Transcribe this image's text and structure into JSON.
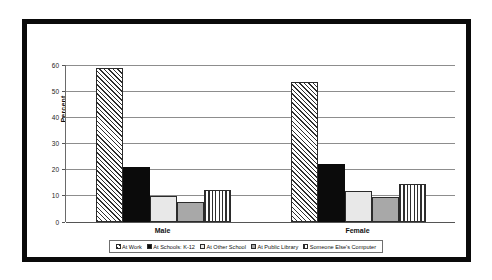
{
  "chart_data": {
    "type": "bar",
    "title": "",
    "xlabel": "",
    "ylabel": "Percent",
    "ylim": [
      0,
      60
    ],
    "yticks": [
      0,
      10,
      20,
      30,
      40,
      50,
      60
    ],
    "grid": true,
    "legend_position": "bottom",
    "categories": [
      "Male",
      "Female"
    ],
    "series": [
      {
        "name": "At Work",
        "pattern": "diagonal-hatch",
        "color": "#ffffff",
        "values": [
          59.0,
          53.7
        ]
      },
      {
        "name": "At Schools: K-12",
        "pattern": "solid-black",
        "color": "#0b0b0b",
        "values": [
          21.0,
          22.3
        ]
      },
      {
        "name": "At Other School",
        "pattern": "light-gray",
        "color": "#e8e8e8",
        "values": [
          9.8,
          12.0
        ]
      },
      {
        "name": "At Public Library",
        "pattern": "medium-gray",
        "color": "#a8a8a8",
        "values": [
          7.6,
          9.4
        ]
      },
      {
        "name": "Someone Else's Computer",
        "pattern": "vertical-stripe",
        "color": "#ffffff",
        "values": [
          12.3,
          14.6
        ]
      }
    ]
  },
  "axis": {
    "y_title": "Percent",
    "y_tick_labels": [
      "60",
      "50",
      "40",
      "30",
      "20",
      "10",
      "0"
    ]
  },
  "groups": [
    {
      "label": "Male"
    },
    {
      "label": "Female"
    }
  ],
  "legend": {
    "items": [
      {
        "label": "At Work"
      },
      {
        "label": "At Schools: K-12"
      },
      {
        "label": "At Other School"
      },
      {
        "label": "At Public Library"
      },
      {
        "label": "Someone Else's Computer"
      }
    ]
  }
}
